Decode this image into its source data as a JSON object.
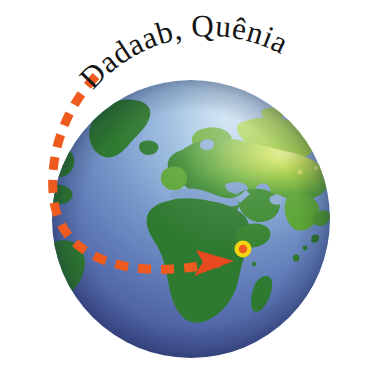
{
  "image": {
    "type": "globe-locator-illustration",
    "width": 367,
    "height": 386,
    "background_color": "#ffffff",
    "description": "Illustration of planet Earth showing Europe, Africa and Asia, with a dashed orange flight-path arrow curving in from the upper left and an arrowhead pointing to a target marker in East Africa."
  },
  "label": {
    "text": "Dadaab, Quênia",
    "color": "#141414",
    "style": "curved-arc-serif"
  },
  "globe": {
    "name": "earth-globe",
    "center_x": 191,
    "center_y": 219,
    "radius": 139,
    "ocean_top_color": "#9dc0e0",
    "ocean_mid_color": "#6d8ec4",
    "ocean_deep_color": "#3f4f8e",
    "land_dark_color": "#2f7a31",
    "land_mid_color": "#4f9b33",
    "land_light_color": "#8fc23a",
    "land_highlight_color": "#cfe06a"
  },
  "route": {
    "name": "dashed-flight-path",
    "color": "#ef5a1e",
    "dash_length": 13,
    "dash_gap": 10,
    "stroke_width": 9,
    "start_point": [
      96,
      76
    ],
    "end_point": [
      228,
      262
    ]
  },
  "arrowhead": {
    "name": "route-arrowhead",
    "color": "#e8491f",
    "x": 228,
    "y": 262,
    "direction": "east"
  },
  "marker": {
    "name": "location-marker",
    "label": "Dadaab",
    "x": 243,
    "y": 249,
    "ring_color": "#f4d311",
    "center_color": "#ef5a1e",
    "outer_radius": 9,
    "inner_radius": 4
  },
  "landmasses": [
    {
      "name": "greenland",
      "color": "#2f7a31"
    },
    {
      "name": "iceland",
      "color": "#2f7a31"
    },
    {
      "name": "europe",
      "color": "#6fae35"
    },
    {
      "name": "asia",
      "color": "#8fc23a"
    },
    {
      "name": "africa",
      "color": "#2f7a31"
    },
    {
      "name": "arabian-peninsula",
      "color": "#3c8a32"
    },
    {
      "name": "madagascar",
      "color": "#2f7a31"
    },
    {
      "name": "south-america-edge",
      "color": "#2f7a31"
    },
    {
      "name": "india",
      "color": "#5aa434"
    }
  ]
}
